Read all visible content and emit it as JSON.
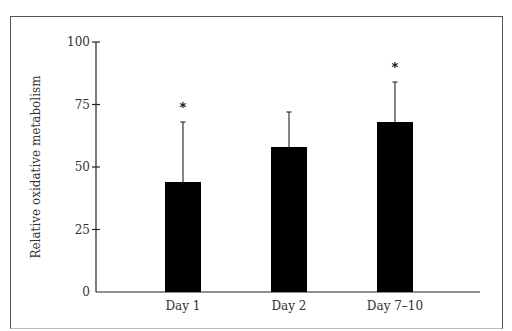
{
  "chart_data": {
    "type": "bar",
    "title": "",
    "xlabel": "",
    "ylabel": "Relative oxidative metabolism",
    "ylim": [
      0,
      100
    ],
    "yticks": [
      0,
      25,
      50,
      75,
      100
    ],
    "categories": [
      "Day 1",
      "Day 2",
      "Day 7–10"
    ],
    "values": [
      44,
      58,
      68
    ],
    "error_upper": [
      68,
      72,
      84
    ],
    "significance": [
      "*",
      "",
      "*"
    ],
    "bar_color": "#000000",
    "grid": false,
    "legend": null
  },
  "axis": {
    "ylabel": "Relative oxidative metabolism",
    "ytick_labels": [
      "0",
      "25",
      "50",
      "75",
      "100"
    ]
  }
}
